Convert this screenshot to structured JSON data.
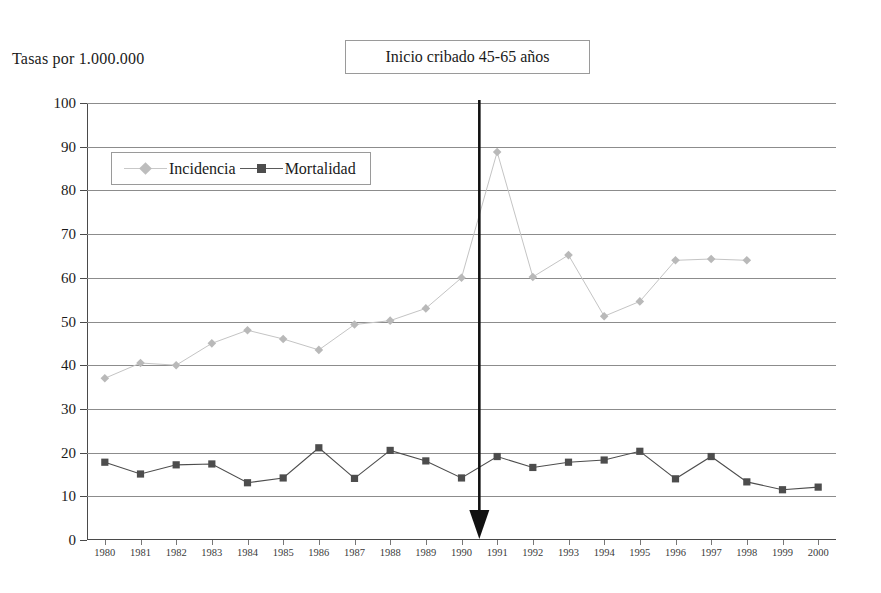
{
  "chart_data": {
    "type": "line",
    "title": "",
    "xlabel": "",
    "ylabel": "Tasas por 1.000.000",
    "ylim": [
      0,
      100
    ],
    "ytick_step": 10,
    "grid": true,
    "legend_position": "inside-top-left",
    "categories": [
      "1980",
      "1981",
      "1982",
      "1983",
      "1984",
      "1985",
      "1986",
      "1987",
      "1988",
      "1989",
      "1990",
      "1991",
      "1992",
      "1993",
      "1994",
      "1995",
      "1996",
      "1997",
      "1998",
      "1999",
      "2000"
    ],
    "yticks": [
      "0",
      "10",
      "20",
      "30",
      "40",
      "50",
      "60",
      "70",
      "80",
      "90",
      "100"
    ],
    "series": [
      {
        "name": "Incidencia",
        "color": "#c4c4c4",
        "marker": "diamond",
        "values": [
          37.0,
          40.5,
          40.0,
          45.0,
          48.0,
          46.0,
          43.5,
          49.3,
          50.2,
          53.0,
          60.0,
          88.8,
          60.2,
          65.2,
          51.2,
          54.6,
          64.0,
          64.3,
          64.0,
          null,
          null
        ]
      },
      {
        "name": "Mortalidad",
        "color": "#4d4d4d",
        "marker": "square",
        "values": [
          17.8,
          15.1,
          17.2,
          17.4,
          13.1,
          14.2,
          21.1,
          14.1,
          20.5,
          18.1,
          14.2,
          19.1,
          16.6,
          17.8,
          18.3,
          20.3,
          14.0,
          19.1,
          13.3,
          11.5,
          12.1
        ]
      }
    ],
    "annotations": [
      {
        "id": "screening-start",
        "label": "Inicio cribado 45-65 años",
        "type": "vertical-arrow",
        "x_position": "between 1990 and 1991",
        "x_value": 1990.5
      }
    ]
  },
  "axis": {
    "y_caption": "Tasas por 1.000.000"
  },
  "legend": {
    "incidencia_label": "Incidencia",
    "mortalidad_label": "Mortalidad"
  },
  "annotation": {
    "screening_label": "Inicio cribado 45-65 años"
  },
  "colors": {
    "incidencia": "#c4c4c4",
    "mortalidad": "#4d4d4d",
    "gridline": "#8c8c8c",
    "axis": "#4a4a4a",
    "annotation_arrow": "#111111",
    "box_border": "#9a9a9a"
  }
}
